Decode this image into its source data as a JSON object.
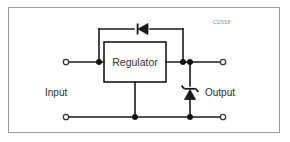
{
  "figure": {
    "part_code": "CD558",
    "background_color": "#ffffff",
    "border_color": "#9a9a9a",
    "wire_color": "#1a1a1a"
  },
  "labels": {
    "regulator": "Regulator",
    "input": "Input",
    "output": "Output"
  },
  "components": [
    {
      "name": "regulator-block",
      "type": "block",
      "label": "Regulator"
    },
    {
      "name": "protection-diode",
      "type": "diode",
      "orientation": "horizontal",
      "cathode_side": "left",
      "description": "reverse protection diode across regulator"
    },
    {
      "name": "zener-diode",
      "type": "zener-diode",
      "orientation": "vertical",
      "cathode_side": "top",
      "description": "output clamp zener to ground"
    }
  ],
  "terminals": [
    {
      "name": "input-positive-terminal",
      "style": "open-circle"
    },
    {
      "name": "input-negative-terminal",
      "style": "open-circle"
    },
    {
      "name": "output-positive-terminal",
      "style": "open-circle"
    },
    {
      "name": "output-negative-terminal",
      "style": "open-circle"
    }
  ],
  "junctions": [
    {
      "name": "input-node-junction"
    },
    {
      "name": "output-node-junction"
    },
    {
      "name": "output-rail-junction"
    },
    {
      "name": "ground-regulator-junction"
    },
    {
      "name": "ground-zener-junction"
    }
  ]
}
